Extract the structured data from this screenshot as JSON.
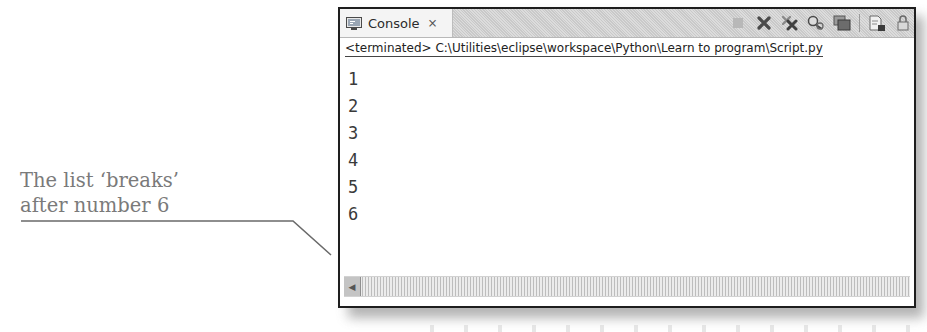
{
  "annotation": {
    "lines": [
      "The list ‘breaks’",
      "after number 6"
    ],
    "color": "#7a7a7a"
  },
  "console": {
    "tab": {
      "label": "Console",
      "icon": "console-icon",
      "close_icon": "close-icon"
    },
    "toolbar": {
      "icons": [
        "terminate-icon",
        "remove-launch-icon",
        "remove-all-terminated-icon",
        "show-console-on-output-icon",
        "display-selected-console-icon",
        "new-console-view-icon",
        "scroll-lock-icon"
      ]
    },
    "status": "<terminated> C:\\Utilities\\eclipse\\workspace\\Python\\Learn to program\\Script.py",
    "output_lines": [
      "1",
      "2",
      "3",
      "4",
      "5",
      "6"
    ],
    "scrollbar": {
      "orientation": "horizontal",
      "left_arrow": "◀"
    }
  }
}
